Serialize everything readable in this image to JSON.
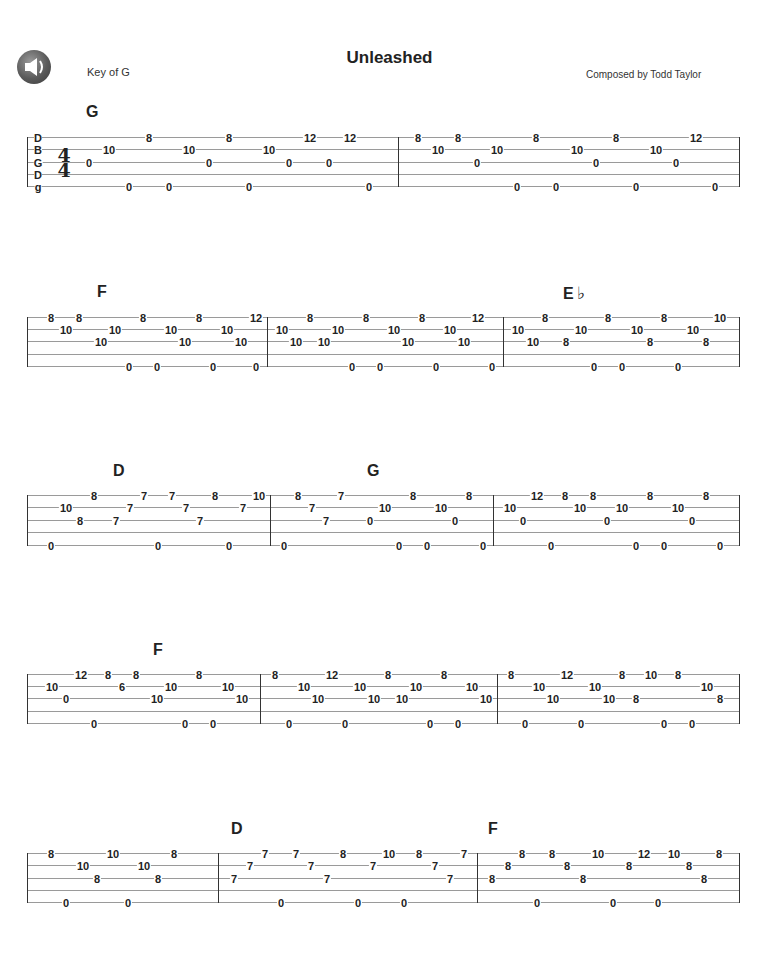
{
  "header": {
    "title": "Unleashed",
    "key": "Key of G",
    "composer": "Composed by Todd Taylor",
    "speaker_icon": "speaker-icon"
  },
  "tuning": [
    "D",
    "B",
    "G",
    "D",
    "g"
  ],
  "time_signature": {
    "top": "4",
    "bottom": "4"
  },
  "systems": [
    {
      "lines_y": [
        137,
        149,
        162,
        174,
        186
      ],
      "x0": 27,
      "x1": 739,
      "bars": [
        398,
        739
      ],
      "chords": [
        {
          "label": "G",
          "x": 86,
          "y": 103
        }
      ],
      "notes": [
        {
          "s": 2,
          "x": 89,
          "f": "0"
        },
        {
          "s": 1,
          "x": 109,
          "f": "10"
        },
        {
          "s": 4,
          "x": 129,
          "f": "0"
        },
        {
          "s": 0,
          "x": 149,
          "f": "8"
        },
        {
          "s": 4,
          "x": 169,
          "f": "0"
        },
        {
          "s": 1,
          "x": 189,
          "f": "10"
        },
        {
          "s": 2,
          "x": 209,
          "f": "0"
        },
        {
          "s": 0,
          "x": 229,
          "f": "8"
        },
        {
          "s": 4,
          "x": 249,
          "f": "0"
        },
        {
          "s": 1,
          "x": 269,
          "f": "10"
        },
        {
          "s": 2,
          "x": 289,
          "f": "0"
        },
        {
          "s": 0,
          "x": 310,
          "f": "12"
        },
        {
          "s": 2,
          "x": 329,
          "f": "0"
        },
        {
          "s": 0,
          "x": 350,
          "f": "12"
        },
        {
          "s": 4,
          "x": 369,
          "f": "0"
        },
        {
          "s": 0,
          "x": 418,
          "f": "8"
        },
        {
          "s": 1,
          "x": 438,
          "f": "10"
        },
        {
          "s": 0,
          "x": 458,
          "f": "8"
        },
        {
          "s": 2,
          "x": 477,
          "f": "0"
        },
        {
          "s": 1,
          "x": 497,
          "f": "10"
        },
        {
          "s": 4,
          "x": 517,
          "f": "0"
        },
        {
          "s": 0,
          "x": 536,
          "f": "8"
        },
        {
          "s": 4,
          "x": 556,
          "f": "0"
        },
        {
          "s": 1,
          "x": 577,
          "f": "10"
        },
        {
          "s": 2,
          "x": 596,
          "f": "0"
        },
        {
          "s": 0,
          "x": 616,
          "f": "8"
        },
        {
          "s": 4,
          "x": 636,
          "f": "0"
        },
        {
          "s": 1,
          "x": 656,
          "f": "10"
        },
        {
          "s": 2,
          "x": 676,
          "f": "0"
        },
        {
          "s": 0,
          "x": 696,
          "f": "12"
        },
        {
          "s": 4,
          "x": 715,
          "f": "0"
        }
      ]
    },
    {
      "lines_y": [
        317,
        329,
        341,
        354,
        366
      ],
      "x0": 27,
      "x1": 739,
      "bars": [
        27,
        267,
        503,
        739
      ],
      "chords": [
        {
          "label": "F",
          "x": 97,
          "y": 283
        },
        {
          "label": "E",
          "flat": "♭",
          "x": 563,
          "y": 283
        }
      ],
      "notes": [
        {
          "s": 0,
          "x": 51,
          "f": "8"
        },
        {
          "s": 1,
          "x": 66,
          "f": "10"
        },
        {
          "s": 0,
          "x": 79,
          "f": "8"
        },
        {
          "s": 2,
          "x": 101,
          "f": "10"
        },
        {
          "s": 1,
          "x": 115,
          "f": "10"
        },
        {
          "s": 4,
          "x": 129,
          "f": "0"
        },
        {
          "s": 0,
          "x": 143,
          "f": "8"
        },
        {
          "s": 4,
          "x": 157,
          "f": "0"
        },
        {
          "s": 1,
          "x": 171,
          "f": "10"
        },
        {
          "s": 2,
          "x": 185,
          "f": "10"
        },
        {
          "s": 0,
          "x": 199,
          "f": "8"
        },
        {
          "s": 4,
          "x": 213,
          "f": "0"
        },
        {
          "s": 1,
          "x": 227,
          "f": "10"
        },
        {
          "s": 2,
          "x": 241,
          "f": "10"
        },
        {
          "s": 0,
          "x": 256,
          "f": "12"
        },
        {
          "s": 4,
          "x": 256,
          "f": "0"
        },
        {
          "s": 1,
          "x": 282,
          "f": "10"
        },
        {
          "s": 2,
          "x": 296,
          "f": "10"
        },
        {
          "s": 0,
          "x": 310,
          "f": "8"
        },
        {
          "s": 2,
          "x": 324,
          "f": "10"
        },
        {
          "s": 1,
          "x": 338,
          "f": "10"
        },
        {
          "s": 4,
          "x": 352,
          "f": "0"
        },
        {
          "s": 0,
          "x": 366,
          "f": "8"
        },
        {
          "s": 4,
          "x": 380,
          "f": "0"
        },
        {
          "s": 1,
          "x": 394,
          "f": "10"
        },
        {
          "s": 2,
          "x": 408,
          "f": "10"
        },
        {
          "s": 0,
          "x": 422,
          "f": "8"
        },
        {
          "s": 4,
          "x": 436,
          "f": "0"
        },
        {
          "s": 1,
          "x": 450,
          "f": "10"
        },
        {
          "s": 2,
          "x": 464,
          "f": "10"
        },
        {
          "s": 0,
          "x": 478,
          "f": "12"
        },
        {
          "s": 4,
          "x": 492,
          "f": "0"
        },
        {
          "s": 1,
          "x": 518,
          "f": "10"
        },
        {
          "s": 2,
          "x": 533,
          "f": "10"
        },
        {
          "s": 0,
          "x": 545,
          "f": "8"
        },
        {
          "s": 2,
          "x": 566,
          "f": "8"
        },
        {
          "s": 1,
          "x": 581,
          "f": "10"
        },
        {
          "s": 4,
          "x": 594,
          "f": "0"
        },
        {
          "s": 0,
          "x": 608,
          "f": "8"
        },
        {
          "s": 4,
          "x": 622,
          "f": "0"
        },
        {
          "s": 1,
          "x": 637,
          "f": "10"
        },
        {
          "s": 2,
          "x": 650,
          "f": "8"
        },
        {
          "s": 0,
          "x": 664,
          "f": "8"
        },
        {
          "s": 4,
          "x": 678,
          "f": "0"
        },
        {
          "s": 1,
          "x": 693,
          "f": "10"
        },
        {
          "s": 2,
          "x": 706,
          "f": "8"
        },
        {
          "s": 0,
          "x": 720,
          "f": "10"
        }
      ]
    },
    {
      "lines_y": [
        495,
        507,
        520,
        532,
        545
      ],
      "x0": 27,
      "x1": 739,
      "bars": [
        27,
        270,
        493,
        739
      ],
      "chords": [
        {
          "label": "D",
          "x": 113,
          "y": 462
        },
        {
          "label": "G",
          "x": 367,
          "y": 462
        }
      ],
      "notes": [
        {
          "s": 4,
          "x": 51,
          "f": "0"
        },
        {
          "s": 1,
          "x": 66,
          "f": "10"
        },
        {
          "s": 2,
          "x": 80,
          "f": "8"
        },
        {
          "s": 0,
          "x": 94,
          "f": "8"
        },
        {
          "s": 2,
          "x": 116,
          "f": "7"
        },
        {
          "s": 1,
          "x": 130,
          "f": "7"
        },
        {
          "s": 0,
          "x": 144,
          "f": "7"
        },
        {
          "s": 4,
          "x": 158,
          "f": "0"
        },
        {
          "s": 0,
          "x": 172,
          "f": "7"
        },
        {
          "s": 1,
          "x": 186,
          "f": "7"
        },
        {
          "s": 2,
          "x": 200,
          "f": "7"
        },
        {
          "s": 0,
          "x": 215,
          "f": "8"
        },
        {
          "s": 4,
          "x": 229,
          "f": "0"
        },
        {
          "s": 1,
          "x": 243,
          "f": "7"
        },
        {
          "s": 0,
          "x": 259,
          "f": "10"
        },
        {
          "s": 4,
          "x": 284,
          "f": "0"
        },
        {
          "s": 0,
          "x": 298,
          "f": "8"
        },
        {
          "s": 1,
          "x": 312,
          "f": "7"
        },
        {
          "s": 2,
          "x": 326,
          "f": "7"
        },
        {
          "s": 0,
          "x": 341,
          "f": "7"
        },
        {
          "s": 2,
          "x": 370,
          "f": "0"
        },
        {
          "s": 1,
          "x": 385,
          "f": "10"
        },
        {
          "s": 4,
          "x": 399,
          "f": "0"
        },
        {
          "s": 0,
          "x": 413,
          "f": "8"
        },
        {
          "s": 4,
          "x": 427,
          "f": "0"
        },
        {
          "s": 1,
          "x": 441,
          "f": "10"
        },
        {
          "s": 2,
          "x": 455,
          "f": "0"
        },
        {
          "s": 0,
          "x": 469,
          "f": "8"
        },
        {
          "s": 4,
          "x": 483,
          "f": "0"
        },
        {
          "s": 1,
          "x": 510,
          "f": "10"
        },
        {
          "s": 2,
          "x": 523,
          "f": "0"
        },
        {
          "s": 0,
          "x": 537,
          "f": "12"
        },
        {
          "s": 4,
          "x": 551,
          "f": "0"
        },
        {
          "s": 0,
          "x": 565,
          "f": "8"
        },
        {
          "s": 1,
          "x": 580,
          "f": "10"
        },
        {
          "s": 0,
          "x": 593,
          "f": "8"
        },
        {
          "s": 2,
          "x": 607,
          "f": "0"
        },
        {
          "s": 1,
          "x": 622,
          "f": "10"
        },
        {
          "s": 4,
          "x": 636,
          "f": "0"
        },
        {
          "s": 0,
          "x": 650,
          "f": "8"
        },
        {
          "s": 4,
          "x": 664,
          "f": "0"
        },
        {
          "s": 1,
          "x": 678,
          "f": "10"
        },
        {
          "s": 2,
          "x": 692,
          "f": "0"
        },
        {
          "s": 0,
          "x": 706,
          "f": "8"
        },
        {
          "s": 4,
          "x": 720,
          "f": "0"
        }
      ]
    },
    {
      "lines_y": [
        674,
        686,
        698,
        711,
        723
      ],
      "x0": 27,
      "x1": 739,
      "bars": [
        27,
        260,
        497,
        739
      ],
      "chords": [
        {
          "label": "F",
          "x": 153,
          "y": 641
        }
      ],
      "notes": [
        {
          "s": 1,
          "x": 52,
          "f": "10"
        },
        {
          "s": 2,
          "x": 66,
          "f": "0"
        },
        {
          "s": 0,
          "x": 81,
          "f": "12"
        },
        {
          "s": 4,
          "x": 94,
          "f": "0"
        },
        {
          "s": 0,
          "x": 108,
          "f": "8"
        },
        {
          "s": 1,
          "x": 122,
          "f": "6"
        },
        {
          "s": 0,
          "x": 136,
          "f": "8"
        },
        {
          "s": 2,
          "x": 157,
          "f": "10"
        },
        {
          "s": 1,
          "x": 171,
          "f": "10"
        },
        {
          "s": 4,
          "x": 185,
          "f": "0"
        },
        {
          "s": 0,
          "x": 199,
          "f": "8"
        },
        {
          "s": 4,
          "x": 213,
          "f": "0"
        },
        {
          "s": 1,
          "x": 228,
          "f": "10"
        },
        {
          "s": 2,
          "x": 242,
          "f": "10"
        },
        {
          "s": 0,
          "x": 275,
          "f": "8"
        },
        {
          "s": 4,
          "x": 289,
          "f": "0"
        },
        {
          "s": 1,
          "x": 304,
          "f": "10"
        },
        {
          "s": 2,
          "x": 318,
          "f": "10"
        },
        {
          "s": 0,
          "x": 332,
          "f": "12"
        },
        {
          "s": 4,
          "x": 345,
          "f": "0"
        },
        {
          "s": 1,
          "x": 360,
          "f": "10"
        },
        {
          "s": 2,
          "x": 374,
          "f": "10"
        },
        {
          "s": 0,
          "x": 388,
          "f": "8"
        },
        {
          "s": 2,
          "x": 402,
          "f": "10"
        },
        {
          "s": 1,
          "x": 416,
          "f": "10"
        },
        {
          "s": 4,
          "x": 430,
          "f": "0"
        },
        {
          "s": 0,
          "x": 444,
          "f": "8"
        },
        {
          "s": 4,
          "x": 458,
          "f": "0"
        },
        {
          "s": 1,
          "x": 472,
          "f": "10"
        },
        {
          "s": 2,
          "x": 486,
          "f": "10"
        },
        {
          "s": 0,
          "x": 511,
          "f": "8"
        },
        {
          "s": 4,
          "x": 525,
          "f": "0"
        },
        {
          "s": 1,
          "x": 539,
          "f": "10"
        },
        {
          "s": 2,
          "x": 553,
          "f": "10"
        },
        {
          "s": 0,
          "x": 567,
          "f": "12"
        },
        {
          "s": 4,
          "x": 581,
          "f": "0"
        },
        {
          "s": 1,
          "x": 595,
          "f": "10"
        },
        {
          "s": 2,
          "x": 609,
          "f": "10"
        },
        {
          "s": 0,
          "x": 622,
          "f": "8"
        },
        {
          "s": 2,
          "x": 636,
          "f": "8"
        },
        {
          "s": 0,
          "x": 651,
          "f": "10"
        },
        {
          "s": 4,
          "x": 664,
          "f": "0"
        },
        {
          "s": 0,
          "x": 678,
          "f": "8"
        },
        {
          "s": 4,
          "x": 692,
          "f": "0"
        },
        {
          "s": 1,
          "x": 707,
          "f": "10"
        },
        {
          "s": 2,
          "x": 720,
          "f": "8"
        }
      ]
    },
    {
      "lines_y": [
        853,
        865,
        878,
        890,
        902
      ],
      "x0": 27,
      "x1": 739,
      "bars": [
        27,
        218,
        477,
        739
      ],
      "chords": [
        {
          "label": "D",
          "x": 231,
          "y": 820
        },
        {
          "label": "F",
          "x": 488,
          "y": 820
        }
      ],
      "notes": [
        {
          "s": 0,
          "x": 51,
          "f": "8"
        },
        {
          "s": 4,
          "x": 66,
          "f": "0"
        },
        {
          "s": 1,
          "x": 83,
          "f": "10"
        },
        {
          "s": 2,
          "x": 97,
          "f": "8"
        },
        {
          "s": 0,
          "x": 113,
          "f": "10"
        },
        {
          "s": 4,
          "x": 128,
          "f": "0"
        },
        {
          "s": 1,
          "x": 144,
          "f": "10"
        },
        {
          "s": 2,
          "x": 158,
          "f": "8"
        },
        {
          "s": 0,
          "x": 174,
          "f": "8"
        },
        {
          "s": 2,
          "x": 234,
          "f": "7"
        },
        {
          "s": 1,
          "x": 250,
          "f": "7"
        },
        {
          "s": 0,
          "x": 265,
          "f": "7"
        },
        {
          "s": 4,
          "x": 281,
          "f": "0"
        },
        {
          "s": 0,
          "x": 296,
          "f": "7"
        },
        {
          "s": 1,
          "x": 311,
          "f": "7"
        },
        {
          "s": 2,
          "x": 327,
          "f": "7"
        },
        {
          "s": 0,
          "x": 343,
          "f": "8"
        },
        {
          "s": 4,
          "x": 358,
          "f": "0"
        },
        {
          "s": 1,
          "x": 373,
          "f": "7"
        },
        {
          "s": 0,
          "x": 389,
          "f": "10"
        },
        {
          "s": 4,
          "x": 404,
          "f": "0"
        },
        {
          "s": 0,
          "x": 419,
          "f": "8"
        },
        {
          "s": 1,
          "x": 435,
          "f": "7"
        },
        {
          "s": 2,
          "x": 450,
          "f": "7"
        },
        {
          "s": 0,
          "x": 464,
          "f": "7"
        },
        {
          "s": 2,
          "x": 492,
          "f": "8"
        },
        {
          "s": 1,
          "x": 508,
          "f": "8"
        },
        {
          "s": 0,
          "x": 522,
          "f": "8"
        },
        {
          "s": 4,
          "x": 537,
          "f": "0"
        },
        {
          "s": 0,
          "x": 552,
          "f": "8"
        },
        {
          "s": 1,
          "x": 567,
          "f": "8"
        },
        {
          "s": 2,
          "x": 583,
          "f": "8"
        },
        {
          "s": 0,
          "x": 598,
          "f": "10"
        },
        {
          "s": 4,
          "x": 613,
          "f": "0"
        },
        {
          "s": 1,
          "x": 629,
          "f": "8"
        },
        {
          "s": 0,
          "x": 644,
          "f": "12"
        },
        {
          "s": 4,
          "x": 658,
          "f": "0"
        },
        {
          "s": 0,
          "x": 674,
          "f": "10"
        },
        {
          "s": 1,
          "x": 689,
          "f": "8"
        },
        {
          "s": 2,
          "x": 704,
          "f": "8"
        },
        {
          "s": 0,
          "x": 719,
          "f": "8"
        }
      ]
    }
  ]
}
